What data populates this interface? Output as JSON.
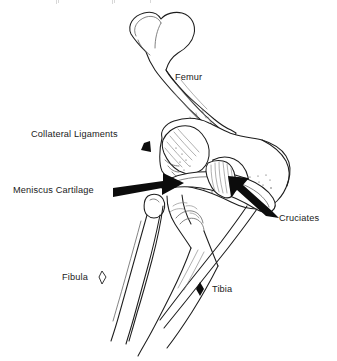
{
  "figure": {
    "background_color": "#ffffff",
    "ink_color": "#1d1d1d",
    "arrow_color": "#0c0c0c",
    "width": 337,
    "height": 361
  },
  "labels": {
    "femur": "Femur",
    "collateral_ligaments": "Collateral Ligaments",
    "meniscus_cartilage": "Meniscus Cartilage",
    "cruciates": "Cruciates",
    "fibula": "Fibula",
    "tibia": "Tibia"
  },
  "pointers": [
    {
      "name": "meniscus-arrow",
      "label": "Meniscus Cartilage",
      "style": "solid-block-arrow",
      "direction": "right-up",
      "from": [
        113,
        193
      ],
      "to": [
        182,
        183
      ]
    },
    {
      "name": "cruciates-arrow",
      "label": "Cruciates",
      "style": "solid-block-arrow",
      "direction": "up-left",
      "from": [
        277,
        213
      ],
      "to": [
        227,
        179
      ]
    },
    {
      "name": "collateral-ligaments-marker",
      "label": "Collateral Ligaments",
      "style": "small-solid-wedge",
      "direction": "down-left",
      "at": [
        146,
        147
      ]
    },
    {
      "name": "fibula-marker",
      "label": "Fibula",
      "style": "small-hollow-diamond",
      "direction": "none",
      "at": [
        102,
        277
      ]
    },
    {
      "name": "tibia-marker",
      "label": "Tibia",
      "style": "small-solid-diamond",
      "direction": "none",
      "at": [
        200,
        289
      ]
    }
  ],
  "structures": [
    {
      "name": "femur",
      "description": "upper long bone running from top-left head diagonally down to the knee condyles"
    },
    {
      "name": "femoral-condyles",
      "description": "rounded lower end of the femur forming the knee joint surface"
    },
    {
      "name": "meniscus-cartilage",
      "description": "crescent shaped cartilage pad between femur and tibia"
    },
    {
      "name": "cruciate-ligaments",
      "description": "hatched fibre bundle crossing inside the joint space"
    },
    {
      "name": "collateral-ligaments",
      "description": "ligament band on the outer side of the joint"
    },
    {
      "name": "tibia",
      "description": "larger lower leg bone descending to lower-left"
    },
    {
      "name": "fibula",
      "description": "thin lower leg bone lateral to the tibia"
    }
  ]
}
